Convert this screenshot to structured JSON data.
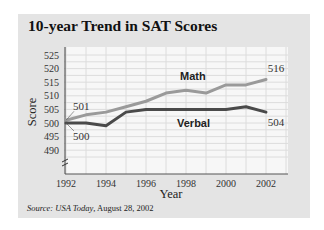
{
  "chart_data": {
    "type": "line",
    "title": "10-year Trend in SAT Scores",
    "xlabel": "Year",
    "ylabel": "Score",
    "x": [
      1992,
      1993,
      1994,
      1995,
      1996,
      1997,
      1998,
      1999,
      2000,
      2001,
      2002
    ],
    "xticks": [
      "1992",
      "1994",
      "1996",
      "1998",
      "2000",
      "2002"
    ],
    "yticks": [
      "490",
      "495",
      "500",
      "505",
      "510",
      "515",
      "520",
      "525"
    ],
    "xlim": [
      1992,
      2002
    ],
    "ylim": [
      485,
      527
    ],
    "grid": true,
    "series": [
      {
        "name": "Math",
        "color": "#9a9a9a",
        "values": [
          501,
          503,
          504,
          506,
          508,
          511,
          512,
          511,
          514,
          514,
          516
        ]
      },
      {
        "name": "Verbal",
        "color": "#4a4a4a",
        "values": [
          500,
          500,
          499,
          504,
          505,
          505,
          505,
          505,
          505,
          506,
          504
        ]
      }
    ],
    "annotations": [
      {
        "text": "501",
        "series": "Math",
        "point": "start"
      },
      {
        "text": "500",
        "series": "Verbal",
        "point": "start"
      },
      {
        "text": "516",
        "series": "Math",
        "point": "end"
      },
      {
        "text": "504",
        "series": "Verbal",
        "point": "end"
      }
    ]
  },
  "source": {
    "prefix": "Source:",
    "publication": "USA Today",
    "date": ", August 28, 2002"
  }
}
